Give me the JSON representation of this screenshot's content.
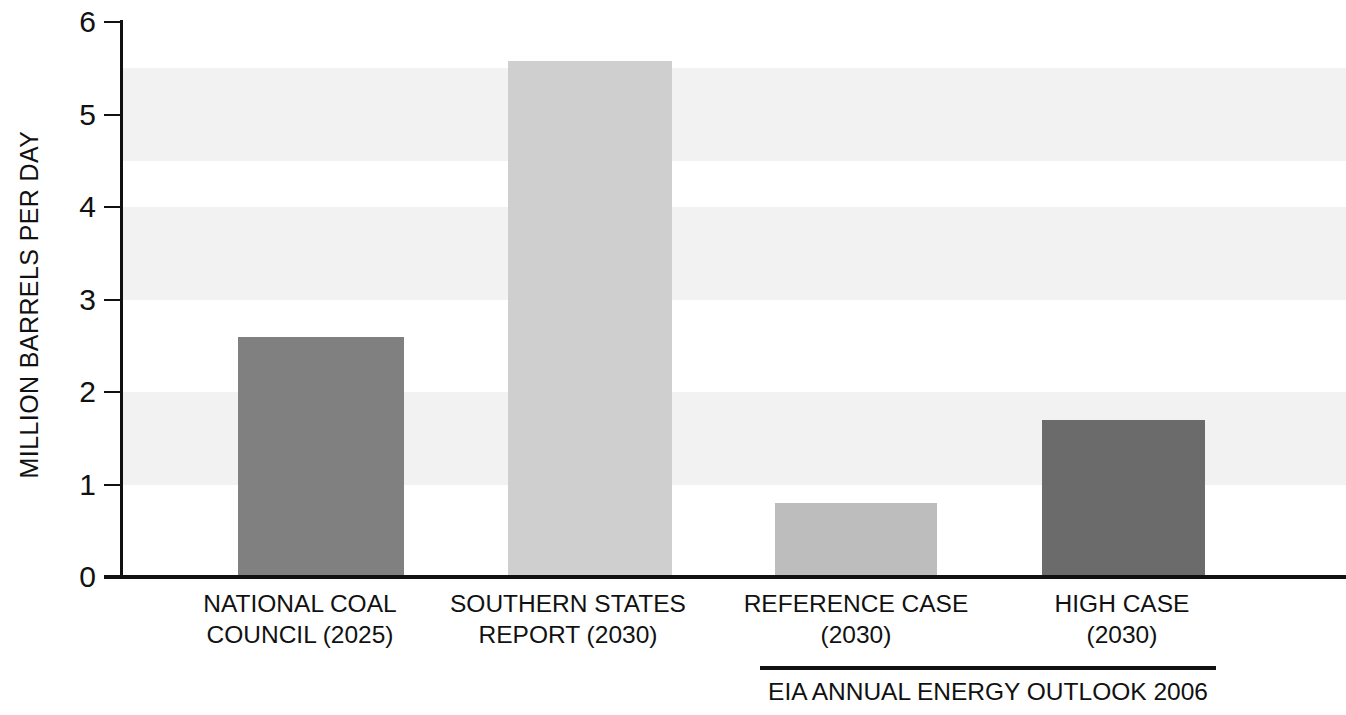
{
  "chart_data": {
    "type": "bar",
    "title": "",
    "subtitle": "",
    "xlabel": "",
    "ylabel": "MILLION BARRELS PER DAY",
    "ylim": [
      0,
      6
    ],
    "ytick_values": [
      0,
      1,
      2,
      3,
      4,
      5,
      6
    ],
    "ytick_labels": [
      "0",
      "1",
      "2",
      "3",
      "4",
      "5",
      "6"
    ],
    "grid": false,
    "alternating_background_bands": true,
    "legend": null,
    "categories": [
      "NATIONAL COAL COUNCIL (2025)",
      "SOUTHERN STATES REPORT (2030)",
      "REFERENCE CASE (2030)",
      "HIGH CASE (2030)"
    ],
    "values": [
      2.6,
      5.58,
      0.8,
      1.7
    ],
    "bar_colors": [
      "#808080",
      "#cfcfcf",
      "#bdbdbd",
      "#6b6b6b"
    ],
    "annotations": [
      {
        "text": "EIA ANNUAL ENERGY OUTLOOK 2006",
        "spans_categories": [
          "REFERENCE CASE (2030)",
          "HIGH CASE (2030)"
        ]
      }
    ]
  },
  "axis": {
    "y_title": "MILLION BARRELS PER DAY",
    "ticks": [
      {
        "label": "6",
        "value": 6
      },
      {
        "label": "5",
        "value": 5
      },
      {
        "label": "4",
        "value": 4
      },
      {
        "label": "3",
        "value": 3
      },
      {
        "label": "2",
        "value": 2
      },
      {
        "label": "1",
        "value": 1
      },
      {
        "label": "0",
        "value": 0
      }
    ]
  },
  "categories": [
    {
      "line1": "NATIONAL COAL",
      "line2": "COUNCIL (2025)"
    },
    {
      "line1": "SOUTHERN STATES",
      "line2": "REPORT (2030)"
    },
    {
      "line1": "REFERENCE CASE",
      "line2": "(2030)"
    },
    {
      "line1": "HIGH CASE",
      "line2": "(2030)"
    }
  ],
  "group": {
    "label": "EIA ANNUAL ENERGY OUTLOOK 2006"
  },
  "colors": {
    "background": "#ffffff",
    "band": "#f2f2f2",
    "axis": "#111111",
    "bar1": "#808080",
    "bar2": "#cfcfcf",
    "bar3": "#bdbdbd",
    "bar4": "#6b6b6b"
  }
}
